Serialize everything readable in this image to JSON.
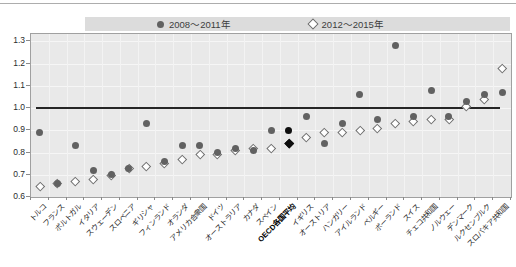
{
  "legend": {
    "series1_label": "2008〜2011年",
    "series2_label": "2012〜2015年"
  },
  "colors": {
    "circle_fill": "#616161",
    "diamond_fill": "#ffffff",
    "diamond_border": "#6e6e6e",
    "highlight_black": "#0f0f0f",
    "baseline_color": "#262626",
    "legend_bar_bg": "#dcdcdc",
    "plot_bg": "#e9e9e9"
  },
  "chart_data": {
    "type": "scatter",
    "title": "",
    "xlabel": "",
    "ylabel": "",
    "ylim": [
      0.6,
      1.333
    ],
    "yticks": [
      "0.6",
      "0.7",
      "0.8",
      "0.9",
      "1.0",
      "1.1",
      "1.2",
      "1.3"
    ],
    "ytick_values": [
      0.6,
      0.7,
      0.8,
      0.9,
      1.0,
      1.1,
      1.2,
      1.3
    ],
    "baseline": 1.0,
    "grid": true,
    "legend_position": "top",
    "highlight_category": "OECD各国平均",
    "categories": [
      "トルコ",
      "フランス",
      "ポルトガル",
      "イタリア",
      "スウェーデン",
      "スロベニア",
      "ギリシャ",
      "フィンランド",
      "オランダ",
      "アメリカ合衆国",
      "ドイツ",
      "オーストラリア",
      "カナダ",
      "スペイン",
      "OECD各国平均",
      "イギリス",
      "オーストリア",
      "ハンガリー",
      "アイルランド",
      "ベルギー",
      "ポーランド",
      "スイス",
      "チェコ共和国",
      "ノルウェー",
      "デンマーク",
      "ルクセンブルク",
      "スロバキア共和国"
    ],
    "series": [
      {
        "name": "2008〜2011年",
        "marker": "circle",
        "values": [
          0.89,
          0.66,
          0.83,
          0.72,
          0.7,
          0.73,
          0.93,
          0.76,
          0.83,
          0.83,
          0.8,
          0.82,
          0.81,
          0.9,
          0.9,
          0.96,
          0.84,
          0.93,
          1.06,
          0.95,
          1.28,
          0.96,
          1.08,
          0.96,
          1.03,
          1.06,
          1.07
        ]
      },
      {
        "name": "2012〜2015年",
        "marker": "diamond",
        "values": [
          0.65,
          0.66,
          0.67,
          0.68,
          0.7,
          0.73,
          0.74,
          0.75,
          0.77,
          0.79,
          0.79,
          0.81,
          0.82,
          0.82,
          0.84,
          0.87,
          0.89,
          0.89,
          0.9,
          0.91,
          0.93,
          0.94,
          0.95,
          0.95,
          1.01,
          1.04,
          1.18
        ]
      }
    ]
  }
}
